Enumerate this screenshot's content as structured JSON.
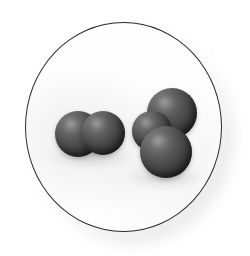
{
  "image": {
    "title": "Space-filling molecular models in a circular frame",
    "background_color": "#ffffff",
    "frame": {
      "shape": "circle",
      "fill_color": "#fefefe",
      "outline_color": "#2b2b2b",
      "outline_width_px": 1.4,
      "center_x": 123,
      "center_y": 127,
      "radius_x": 98,
      "radius_y": 105,
      "shadow": "soft gray diffuse shadow offset to lower-right"
    },
    "atom_style": {
      "fill_color": "#454545",
      "highlight_color": "#8e8e8e",
      "shade_color": "#252525",
      "light_direction": "upper-left"
    },
    "molecules": [
      {
        "id": "diatomic-left",
        "label": "diatomic molecule",
        "atom_count": 2,
        "geometry": "linear",
        "atoms": [
          {
            "id": "atom-a1",
            "cx": 78,
            "cy": 134,
            "r": 23
          },
          {
            "id": "atom-a2",
            "cx": 103,
            "cy": 133,
            "r": 22
          }
        ]
      },
      {
        "id": "triatomic-right",
        "label": "triatomic cluster",
        "atom_count": 3,
        "geometry": "bent / trigonal",
        "atoms": [
          {
            "id": "atom-b1",
            "cx": 172,
            "cy": 113,
            "r": 25
          },
          {
            "id": "atom-b2",
            "cx": 152,
            "cy": 131,
            "r": 20
          },
          {
            "id": "atom-b3",
            "cx": 166,
            "cy": 152,
            "r": 26
          }
        ]
      }
    ]
  }
}
